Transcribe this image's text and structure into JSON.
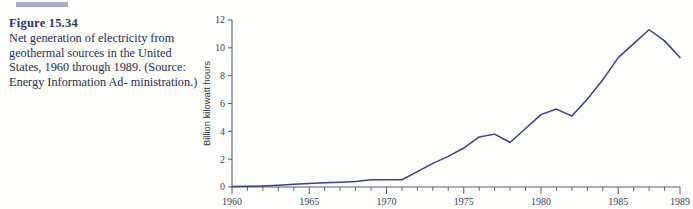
{
  "figure": {
    "label": "Figure 15.34",
    "caption": "Net generation of electricity from geothermal sources in the United States, 1960 through 1989. (Source: Energy Information Administration.)",
    "caption_lines": [
      "Net generation of electricity from",
      "geothermal sources in the United",
      "States, 1960 through 1989.",
      "(Source: Energy Information Ad-",
      "ministration.)"
    ],
    "label_color": "#2e3566",
    "caption_color": "#2b2f52",
    "rule_color": "#9aa2bb"
  },
  "chart_data": {
    "type": "line",
    "title": "",
    "xlabel": "",
    "ylabel": "Billion kilowatt hours",
    "xlim": [
      1960,
      1989
    ],
    "ylim": [
      0,
      12
    ],
    "grid": false,
    "legend": "none",
    "line_color": "#3c4382",
    "axis_color": "#5a5f7a",
    "x_ticks_major": [
      1960,
      1965,
      1970,
      1975,
      1980,
      1985,
      1989
    ],
    "x_tick_labels": [
      "1960",
      "1965",
      "1970",
      "1975",
      "1980",
      "1985",
      "1989"
    ],
    "x_ticks_minor_step": 1,
    "y_ticks": [
      0,
      2,
      4,
      6,
      8,
      10,
      12
    ],
    "y_tick_labels": [
      "0",
      "2",
      "4",
      "6",
      "8",
      "10",
      "12"
    ],
    "x": [
      1960,
      1961,
      1962,
      1963,
      1964,
      1965,
      1966,
      1967,
      1968,
      1969,
      1970,
      1971,
      1972,
      1973,
      1974,
      1975,
      1976,
      1977,
      1978,
      1979,
      1980,
      1981,
      1982,
      1983,
      1984,
      1985,
      1986,
      1987,
      1988,
      1989
    ],
    "values": [
      0.03,
      0.05,
      0.08,
      0.13,
      0.2,
      0.25,
      0.3,
      0.35,
      0.4,
      0.52,
      0.52,
      0.52,
      1.1,
      1.7,
      2.2,
      2.8,
      3.6,
      3.8,
      3.2,
      4.2,
      5.2,
      5.6,
      5.1,
      6.3,
      7.7,
      9.3,
      10.3,
      11.3,
      10.5,
      9.3
    ]
  }
}
